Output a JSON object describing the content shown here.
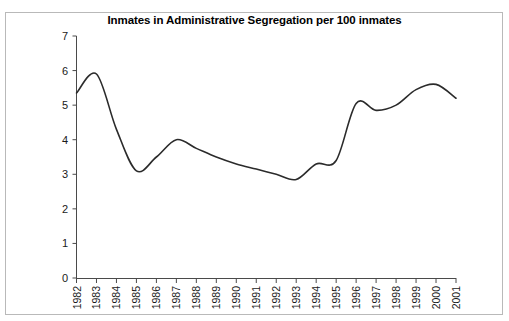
{
  "chart_data": {
    "type": "line",
    "title": "Inmates in Administrative Segregation per 100 inmates",
    "xlabel": "",
    "ylabel": "",
    "ylim": [
      0,
      7
    ],
    "yticks": [
      0,
      1,
      2,
      3,
      4,
      5,
      6,
      7
    ],
    "ytick_labels": [
      "0",
      "1",
      "2",
      "3",
      "4",
      "5",
      "6",
      "7"
    ],
    "grid": false,
    "legend": "none",
    "categories": [
      "1982",
      "1983",
      "1984",
      "1985",
      "1986",
      "1987",
      "1988",
      "1989",
      "1990",
      "1991",
      "1992",
      "1993",
      "1994",
      "1995",
      "1996",
      "1997",
      "1998",
      "1999",
      "2000",
      "2001"
    ],
    "values": [
      5.35,
      5.9,
      4.3,
      3.1,
      3.5,
      4.0,
      3.75,
      3.5,
      3.3,
      3.15,
      3.0,
      2.85,
      3.3,
      3.4,
      5.05,
      4.85,
      5.0,
      5.45,
      5.6,
      5.2
    ],
    "series": [
      {
        "name": "Inmates in Administrative Segregation per 100 inmates",
        "color": "#2b2b2b",
        "values": [
          5.35,
          5.9,
          4.3,
          3.1,
          3.5,
          4.0,
          3.75,
          3.5,
          3.3,
          3.15,
          3.0,
          2.85,
          3.3,
          3.4,
          5.05,
          4.85,
          5.0,
          5.45,
          5.6,
          5.2
        ]
      }
    ]
  },
  "axes": {
    "y_axis_name": "value-axis",
    "x_axis_name": "year-axis"
  }
}
